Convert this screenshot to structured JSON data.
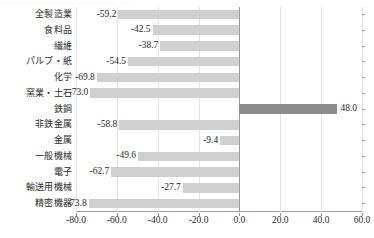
{
  "artifact": {
    "top_cut_text": "— — —— ——— ———————— — —— — — ——"
  },
  "colors": {
    "bar_negative": "#d0d0d0",
    "bar_positive": "#8c8c8c",
    "axis": "#9a9a9a",
    "grid": "#e4e4e4",
    "text": "#2b2b2b"
  },
  "chart_data": {
    "type": "bar",
    "orientation": "horizontal",
    "title": "",
    "xlabel": "",
    "ylabel": "",
    "xlim": [
      -80.0,
      60.0
    ],
    "xticks": [
      "-80.0",
      "-60.0",
      "-40.0",
      "-20.0",
      "0.0",
      "20.0",
      "40.0",
      "60.0"
    ],
    "xtick_values": [
      -80.0,
      -60.0,
      -40.0,
      -20.0,
      0.0,
      20.0,
      40.0,
      60.0
    ],
    "grid": true,
    "legend": "none",
    "categories": [
      "全製造業",
      "食料品",
      "繊維",
      "パルプ・紙",
      "化学",
      "窯業・土石",
      "鉄鋼",
      "非鉄金属",
      "金属",
      "一般機械",
      "電子",
      "輸送用機械",
      "精密機器"
    ],
    "values": [
      -59.2,
      -42.5,
      -38.7,
      -54.5,
      -69.8,
      -73.0,
      48.0,
      -58.8,
      -9.4,
      -49.6,
      -62.7,
      -27.7,
      -73.8
    ],
    "labels": [
      "-59.2",
      "-42.5",
      "-38.7",
      "-54.5",
      "-69.8",
      "-73.0",
      "48.0",
      "-58.8",
      "-9.4",
      "-49.6",
      "-62.7",
      "-27.7",
      "-73.8"
    ]
  }
}
